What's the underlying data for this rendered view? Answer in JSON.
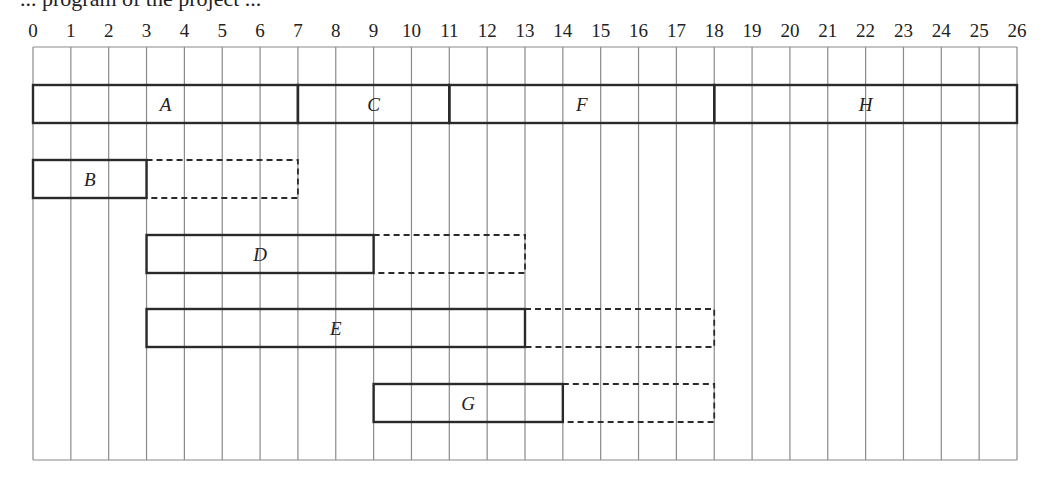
{
  "caption": "... program of the project ...",
  "chart_data": {
    "type": "gantt",
    "title": "",
    "xlabel": "",
    "ylabel": "",
    "x_ticks": [
      0,
      1,
      2,
      3,
      4,
      5,
      6,
      7,
      8,
      9,
      10,
      11,
      12,
      13,
      14,
      15,
      16,
      17,
      18,
      19,
      20,
      21,
      22,
      23,
      24,
      25,
      26
    ],
    "xlim": [
      0,
      26
    ],
    "grid": true,
    "rows": [
      {
        "tasks": [
          {
            "name": "A",
            "start": 0,
            "end": 7,
            "float_end": null
          },
          {
            "name": "C",
            "start": 7,
            "end": 11,
            "float_end": null
          },
          {
            "name": "F",
            "start": 11,
            "end": 18,
            "float_end": null
          },
          {
            "name": "H",
            "start": 18,
            "end": 26,
            "float_end": null
          }
        ]
      },
      {
        "tasks": [
          {
            "name": "B",
            "start": 0,
            "end": 3,
            "float_end": 7
          }
        ]
      },
      {
        "tasks": [
          {
            "name": "D",
            "start": 3,
            "end": 9,
            "float_end": 13
          }
        ]
      },
      {
        "tasks": [
          {
            "name": "E",
            "start": 3,
            "end": 13,
            "float_end": 18
          }
        ]
      },
      {
        "tasks": [
          {
            "name": "G",
            "start": 9,
            "end": 14,
            "float_end": 18
          }
        ]
      }
    ],
    "legend": {
      "solid": "activity duration",
      "dashed": "float (slack)"
    }
  },
  "colors": {
    "grid": "#8a8a8a",
    "bar": "#2a2a2a",
    "text": "#222222"
  }
}
